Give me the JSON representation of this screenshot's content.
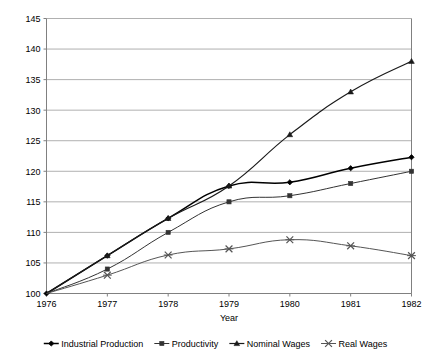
{
  "chart_data": {
    "type": "line",
    "title": "",
    "xlabel": "Year",
    "ylabel": "",
    "categories": [
      "1976",
      "1977",
      "1978",
      "1979",
      "1980",
      "1981",
      "1982"
    ],
    "x": [
      1976,
      1977,
      1978,
      1979,
      1980,
      1981,
      1982
    ],
    "xlim": [
      1976,
      1982
    ],
    "ylim": [
      100,
      145
    ],
    "ytick_labels": [
      "100",
      "105",
      "110",
      "115",
      "120",
      "125",
      "130",
      "135",
      "140",
      "145"
    ],
    "yticks": [
      100,
      105,
      110,
      115,
      120,
      125,
      130,
      135,
      140,
      145
    ],
    "grid": "horizontal",
    "legend_position": "bottom",
    "series": [
      {
        "name": "Industrial Production",
        "marker": "diamond",
        "color": "#000000",
        "values": [
          100,
          106.2,
          112.3,
          117.6,
          118.2,
          120.5,
          122.3
        ]
      },
      {
        "name": "Productivity",
        "marker": "square",
        "color": "#333333",
        "values": [
          100,
          104.0,
          110.0,
          115.0,
          116.0,
          118.0,
          120.0
        ]
      },
      {
        "name": "Nominal Wages",
        "marker": "triangle",
        "color": "#1a1a1a",
        "values": [
          100,
          106.2,
          112.3,
          117.6,
          126.0,
          133.0,
          138.0
        ]
      },
      {
        "name": "Real Wages",
        "marker": "cross",
        "color": "#555555",
        "values": [
          100,
          103.0,
          106.3,
          107.3,
          108.8,
          107.8,
          106.2
        ]
      }
    ]
  },
  "axes": {
    "x_axis_title": "Year",
    "x_tick_labels": [
      "1976",
      "1977",
      "1978",
      "1979",
      "1980",
      "1981",
      "1982"
    ],
    "y_tick_labels": [
      "145",
      "140",
      "135",
      "130",
      "125",
      "120",
      "115",
      "110",
      "105",
      "100"
    ]
  },
  "legend": {
    "items": [
      {
        "label": "Industrial Production",
        "marker": "diamond-marker"
      },
      {
        "label": "Productivity",
        "marker": "square-marker"
      },
      {
        "label": "Nominal Wages",
        "marker": "triangle-marker"
      },
      {
        "label": "Real Wages",
        "marker": "cross-marker"
      }
    ]
  },
  "colors": {
    "plot_border": "#808080",
    "gridline": "#b0b0b0",
    "background": "#ffffff",
    "text": "#000000"
  }
}
